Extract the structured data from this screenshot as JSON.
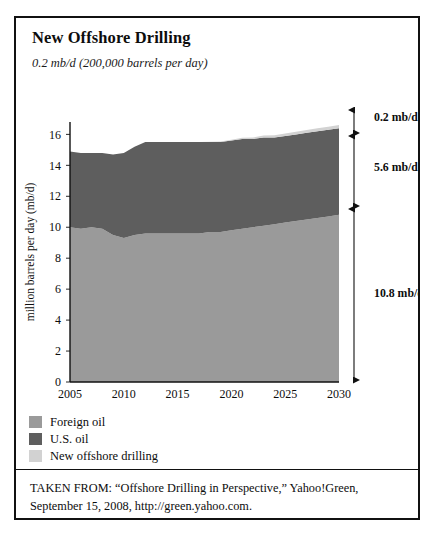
{
  "figure": {
    "title": "New Offshore Drilling",
    "subtitle": "0.2 mb/d (200,000 barrels per day)"
  },
  "legend": {
    "items": [
      {
        "label": "Foreign oil",
        "color": "#9a9a9a",
        "swatch_name": "legend-swatch-foreign-oil"
      },
      {
        "label": "U.S. oil",
        "color": "#5e5e5e",
        "swatch_name": "legend-swatch-us-oil"
      },
      {
        "label": "New offshore drilling",
        "color": "#d2d2d2",
        "swatch_name": "legend-swatch-new-offshore-drilling"
      }
    ]
  },
  "annotations": {
    "new_offshore": "0.2 mb/d",
    "us_oil": "5.6 mb/d",
    "foreign_oil": "10.8 mb/d"
  },
  "source": {
    "line1": "TAKEN FROM: “Offshore Drilling in Perspective,” Yahoo!Green,",
    "line2": "September 15, 2008, http://green.yahoo.com."
  },
  "chart_data": {
    "type": "area",
    "stacked": true,
    "title": "New Offshore Drilling",
    "xlabel": "",
    "ylabel": "million barrels per day (mb/d)",
    "xlim": [
      2005,
      2030
    ],
    "ylim": [
      0,
      16.8
    ],
    "yticks": [
      0,
      2,
      4,
      6,
      8,
      10,
      12,
      14,
      16
    ],
    "ytick_labels": [
      "0",
      "2",
      "4",
      "6",
      "8",
      "10",
      "12",
      "14",
      "16"
    ],
    "xticks": [
      2005,
      2010,
      2015,
      2020,
      2025,
      2030
    ],
    "xtick_labels": [
      "2005",
      "2010",
      "2015",
      "2020",
      "2025",
      "2030"
    ],
    "grid": false,
    "legend_position": "below-left",
    "x": [
      2005,
      2006,
      2007,
      2008,
      2009,
      2010,
      2011,
      2012,
      2013,
      2014,
      2015,
      2016,
      2017,
      2018,
      2019,
      2020,
      2021,
      2022,
      2023,
      2024,
      2025,
      2026,
      2027,
      2028,
      2029,
      2030
    ],
    "series": [
      {
        "name": "Foreign oil",
        "color": "#9a9a9a",
        "values": [
          10.0,
          9.9,
          10.0,
          9.9,
          9.5,
          9.3,
          9.5,
          9.6,
          9.6,
          9.6,
          9.6,
          9.6,
          9.6,
          9.7,
          9.7,
          9.8,
          9.9,
          10.0,
          10.1,
          10.2,
          10.3,
          10.4,
          10.5,
          10.6,
          10.7,
          10.8
        ]
      },
      {
        "name": "U.S. oil",
        "color": "#5e5e5e",
        "values": [
          4.9,
          4.9,
          4.8,
          4.9,
          5.2,
          5.5,
          5.7,
          5.9,
          5.9,
          5.9,
          5.9,
          5.9,
          5.9,
          5.8,
          5.8,
          5.8,
          5.8,
          5.7,
          5.7,
          5.6,
          5.6,
          5.6,
          5.6,
          5.6,
          5.6,
          5.6
        ]
      },
      {
        "name": "New offshore drilling",
        "color": "#d2d2d2",
        "values": [
          0.0,
          0.0,
          0.0,
          0.0,
          0.0,
          0.0,
          0.0,
          0.0,
          0.0,
          0.0,
          0.0,
          0.0,
          0.0,
          0.02,
          0.04,
          0.06,
          0.08,
          0.1,
          0.12,
          0.14,
          0.15,
          0.17,
          0.18,
          0.19,
          0.2,
          0.2
        ]
      }
    ],
    "bracket_totals": {
      "new_offshore_drilling_mbd": 0.2,
      "us_oil_mbd": 5.6,
      "foreign_oil_mbd": 10.8
    }
  }
}
